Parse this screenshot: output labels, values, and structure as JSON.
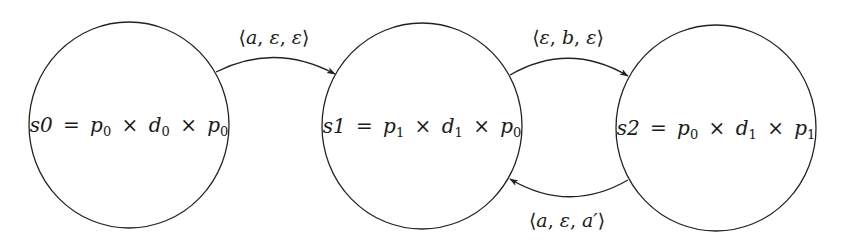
{
  "diagram": {
    "type": "state-machine",
    "states": [
      {
        "id": "s0",
        "name": "s0",
        "p_left": "p",
        "p_left_sub": "0",
        "d": "d",
        "d_sub": "0",
        "p_right": "p",
        "p_right_sub": "0"
      },
      {
        "id": "s1",
        "name": "s1",
        "p_left": "p",
        "p_left_sub": "1",
        "d": "d",
        "d_sub": "1",
        "p_right": "p",
        "p_right_sub": "0"
      },
      {
        "id": "s2",
        "name": "s2",
        "p_left": "p",
        "p_left_sub": "0",
        "d": "d",
        "d_sub": "1",
        "p_right": "p",
        "p_right_sub": "1"
      }
    ],
    "symbols": {
      "equals": "=",
      "times": "×",
      "lang": "⟨",
      "rang": "⟩",
      "comma": ", "
    },
    "transitions": [
      {
        "from": "s0",
        "to": "s1",
        "label": [
          "a",
          "ε",
          "ε"
        ],
        "text": "⟨a, ε, ε⟩"
      },
      {
        "from": "s1",
        "to": "s2",
        "label": [
          "ε",
          "b",
          "ε"
        ],
        "text": "⟨ε, b, ε⟩"
      },
      {
        "from": "s2",
        "to": "s1",
        "label": [
          "a",
          "ε",
          "a′"
        ],
        "text": "⟨a, ε, a′⟩"
      }
    ],
    "colors": {
      "stroke": "#222222",
      "background": "#ffffff"
    }
  }
}
